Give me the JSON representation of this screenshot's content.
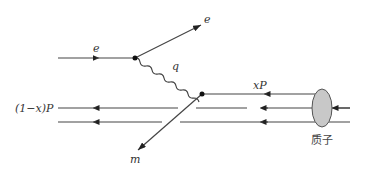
{
  "diagram": {
    "type": "feynman-diagram",
    "labels": {
      "incoming_electron": "e",
      "outgoing_electron": "e",
      "photon": "q",
      "struck_quark": "xP",
      "spectator": "(1−x)P",
      "outgoing_particle": "m",
      "proton": "质子"
    },
    "colors": {
      "line": "#444444",
      "proton_fill": "#c8c8c8",
      "proton_stroke": "#555555",
      "vertex": "#111111"
    }
  }
}
